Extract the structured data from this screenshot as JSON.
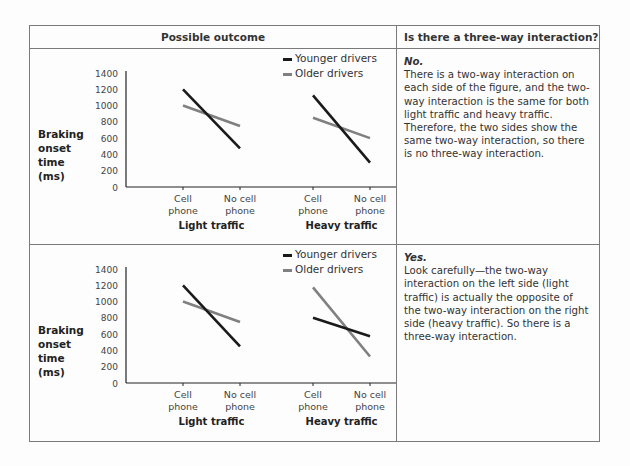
{
  "table": {
    "header_left": "Possible outcome",
    "header_right": "Is there a three-way interaction?"
  },
  "rows": [
    {
      "answer_title": "No.",
      "answer_text": "There is a two-way interaction on each side of the figure, and the two-way interaction is the same for both light traffic and heavy traffic. Therefore, the two sides show the same two-way interaction, so there is no three-way interaction."
    },
    {
      "answer_title": "Yes.",
      "answer_text": "Look carefully—the two-way interaction on the left side (light traffic) is actually the opposite of the two-way interaction on the right side (heavy traffic). So there is a three-way interaction."
    }
  ],
  "axis": {
    "ylabel_lines": [
      "Braking",
      "onset",
      "time",
      "(ms)"
    ],
    "yticks": [
      "0",
      "200",
      "400",
      "600",
      "800",
      "1000",
      "1200",
      "1400"
    ],
    "xticks": [
      [
        "Cell",
        "phone"
      ],
      [
        "No cell",
        "phone"
      ],
      [
        "Cell",
        "phone"
      ],
      [
        "No cell",
        "phone"
      ]
    ],
    "groups": [
      "Light traffic",
      "Heavy traffic"
    ]
  },
  "legend": {
    "younger": "Younger drivers",
    "older": "Older drivers"
  },
  "colors": {
    "younger": "#1a1a1a",
    "older": "#808080",
    "border": "#7a7a7a"
  },
  "chart_data": [
    {
      "type": "line",
      "title": "Possible outcome 1 (no three-way interaction)",
      "ylabel": "Braking onset time (ms)",
      "ylim": [
        0,
        1400
      ],
      "yticks": [
        0,
        200,
        400,
        600,
        800,
        1000,
        1200,
        1400
      ],
      "groups": [
        "Light traffic",
        "Heavy traffic"
      ],
      "categories": [
        "Cell phone",
        "No cell phone"
      ],
      "legend_position": "top-right",
      "grid": false,
      "series": [
        {
          "name": "Younger drivers",
          "light_traffic": [
            1200,
            475
          ],
          "heavy_traffic": [
            1125,
            300
          ]
        },
        {
          "name": "Older drivers",
          "light_traffic": [
            1000,
            750
          ],
          "heavy_traffic": [
            850,
            600
          ]
        }
      ]
    },
    {
      "type": "line",
      "title": "Possible outcome 2 (three-way interaction)",
      "ylabel": "Braking onset time (ms)",
      "ylim": [
        0,
        1400
      ],
      "yticks": [
        0,
        200,
        400,
        600,
        800,
        1000,
        1200,
        1400
      ],
      "groups": [
        "Light traffic",
        "Heavy traffic"
      ],
      "categories": [
        "Cell phone",
        "No cell phone"
      ],
      "legend_position": "top-right",
      "grid": false,
      "series": [
        {
          "name": "Younger drivers",
          "light_traffic": [
            1200,
            450
          ],
          "heavy_traffic": [
            800,
            575
          ]
        },
        {
          "name": "Older drivers",
          "light_traffic": [
            1000,
            750
          ],
          "heavy_traffic": [
            1175,
            325
          ]
        }
      ]
    }
  ]
}
